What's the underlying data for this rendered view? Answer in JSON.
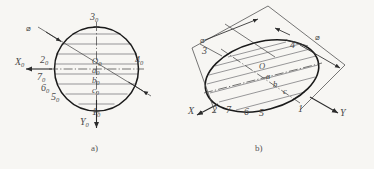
{
  "figure": {
    "title_a": "a)",
    "title_b": "b)",
    "diameter_symbol": "⌀"
  },
  "fig_a": {
    "caption": "a)",
    "axis_x": {
      "label": "X",
      "sub": "0"
    },
    "axis_y": {
      "label": "Y",
      "sub": "0"
    },
    "diameter_label": "⌀",
    "points": [
      {
        "label": "3",
        "sub": "0"
      },
      {
        "label": "2",
        "sub": "0"
      },
      {
        "label": "4",
        "sub": "0"
      },
      {
        "label": "7",
        "sub": "0"
      },
      {
        "label": "6",
        "sub": "0"
      },
      {
        "label": "5",
        "sub": "0"
      },
      {
        "label": "1",
        "sub": "0"
      }
    ],
    "center_points": [
      {
        "label": "O",
        "sub": "0"
      },
      {
        "label": "a",
        "sub": "0"
      },
      {
        "label": "b",
        "sub": "0"
      },
      {
        "label": "c",
        "sub": "0"
      }
    ]
  },
  "fig_b": {
    "caption": "b)",
    "axis_x": {
      "label": "X"
    },
    "axis_y": {
      "label": "Y"
    },
    "diameter_label_left": "⌀",
    "diameter_label_right": "⌀",
    "points": [
      {
        "label": "3"
      },
      {
        "label": "4"
      },
      {
        "label": "2"
      },
      {
        "label": "7"
      },
      {
        "label": "6"
      },
      {
        "label": "5"
      },
      {
        "label": "1"
      }
    ],
    "center_points": [
      {
        "label": "O"
      },
      {
        "label": "a"
      },
      {
        "label": "b"
      },
      {
        "label": "c"
      }
    ]
  },
  "colors": {
    "background": "#f7f6f3",
    "outline": "#1a1a1a",
    "thin_line": "#55565a",
    "axis_line": "#3a3a3a",
    "text": "#4a4a4a"
  }
}
